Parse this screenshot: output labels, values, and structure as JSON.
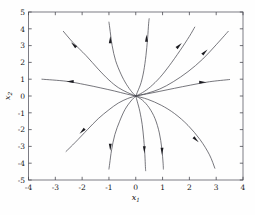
{
  "figure": {
    "background_color": "#fefefe",
    "frame_color": "#6f6f78",
    "curve_color": "#4a4a52",
    "arrow_color": "#1b1b20"
  },
  "chart_data": {
    "type": "line",
    "title": "",
    "subtitle": "",
    "xlabel": "x_1",
    "ylabel": "x_2",
    "xlim": [
      -4,
      4
    ],
    "ylim": [
      -5,
      5
    ],
    "grid": false,
    "legend": null,
    "xticks": [
      -4,
      -3,
      -2,
      -1,
      0,
      1,
      2,
      3,
      4
    ],
    "xtick_labels": [
      "-4",
      "-3",
      "-2",
      "-1",
      "0",
      "1",
      "2",
      "3",
      "4"
    ],
    "yticks": [
      -5,
      -4,
      -3,
      -2,
      -1,
      0,
      1,
      2,
      3,
      4,
      5
    ],
    "ytick_labels": [
      "-5",
      "-4",
      "-3",
      "-2",
      "-1",
      "0",
      "1",
      "2",
      "3",
      "4",
      "5"
    ],
    "equilibrium": [
      0,
      0
    ],
    "equilibrium_type": "unstable improper node",
    "flow_direction": "outward",
    "trajectories": [
      {
        "name": "upper-left-horizontal",
        "arrow_at": [
          -2.45,
          0.86
        ],
        "arrow_direction": "left",
        "points": [
          [
            0,
            0
          ],
          [
            -0.35,
            0.12
          ],
          [
            -0.8,
            0.3
          ],
          [
            -1.3,
            0.48
          ],
          [
            -1.9,
            0.68
          ],
          [
            -2.6,
            0.88
          ],
          [
            -3.5,
            1.0
          ]
        ]
      },
      {
        "name": "upper-left-diagonal",
        "arrow_at": [
          -2.32,
          3.05
        ],
        "arrow_direction": "up-left",
        "points": [
          [
            0,
            0
          ],
          [
            -0.3,
            0.2
          ],
          [
            -0.65,
            0.5
          ],
          [
            -1.0,
            0.95
          ],
          [
            -1.4,
            1.6
          ],
          [
            -1.85,
            2.4
          ],
          [
            -2.35,
            3.2
          ],
          [
            -2.7,
            3.85
          ]
        ]
      },
      {
        "name": "upper-left-steep",
        "arrow_at": [
          -0.95,
          3.35
        ],
        "arrow_direction": "up",
        "points": [
          [
            0,
            0
          ],
          [
            -0.15,
            0.25
          ],
          [
            -0.35,
            0.7
          ],
          [
            -0.55,
            1.3
          ],
          [
            -0.75,
            2.1
          ],
          [
            -0.88,
            3.0
          ],
          [
            -0.97,
            4.05
          ],
          [
            -1.0,
            4.4
          ]
        ]
      },
      {
        "name": "upper-center-steep",
        "arrow_at": [
          0.4,
          3.45
        ],
        "arrow_direction": "up",
        "points": [
          [
            0,
            0
          ],
          [
            0.08,
            0.3
          ],
          [
            0.2,
            0.8
          ],
          [
            0.3,
            1.5
          ],
          [
            0.38,
            2.4
          ],
          [
            0.44,
            3.4
          ],
          [
            0.48,
            4.3
          ],
          [
            0.5,
            4.6
          ]
        ]
      },
      {
        "name": "upper-right-mid",
        "arrow_at": [
          1.62,
          3.0
        ],
        "arrow_direction": "up-right",
        "points": [
          [
            0,
            0
          ],
          [
            0.25,
            0.2
          ],
          [
            0.55,
            0.55
          ],
          [
            0.9,
            1.1
          ],
          [
            1.25,
            1.8
          ],
          [
            1.65,
            2.7
          ],
          [
            2.0,
            3.55
          ],
          [
            2.2,
            4.1
          ]
        ]
      },
      {
        "name": "upper-right-diagonal",
        "arrow_at": [
          2.58,
          2.62
        ],
        "arrow_direction": "up-right",
        "points": [
          [
            0,
            0
          ],
          [
            0.4,
            0.15
          ],
          [
            0.9,
            0.42
          ],
          [
            1.4,
            0.85
          ],
          [
            1.95,
            1.45
          ],
          [
            2.5,
            2.2
          ],
          [
            3.0,
            3.05
          ],
          [
            3.45,
            3.85
          ]
        ]
      },
      {
        "name": "upper-right-horizontal",
        "arrow_at": [
          2.5,
          0.82
        ],
        "arrow_direction": "right",
        "points": [
          [
            0,
            0
          ],
          [
            0.4,
            0.12
          ],
          [
            0.9,
            0.28
          ],
          [
            1.45,
            0.46
          ],
          [
            2.05,
            0.65
          ],
          [
            2.75,
            0.85
          ],
          [
            3.5,
            0.98
          ]
        ]
      },
      {
        "name": "lower-left-diagonal",
        "arrow_at": [
          -2.0,
          -2.1
        ],
        "arrow_direction": "down-left",
        "points": [
          [
            0,
            0
          ],
          [
            -0.3,
            -0.15
          ],
          [
            -0.65,
            -0.42
          ],
          [
            -1.0,
            -0.82
          ],
          [
            -1.4,
            -1.35
          ],
          [
            -1.8,
            -2.0
          ],
          [
            -2.25,
            -2.75
          ],
          [
            -2.6,
            -3.3
          ]
        ]
      },
      {
        "name": "lower-left-steep",
        "arrow_at": [
          -0.95,
          -3.05
        ],
        "arrow_direction": "down",
        "points": [
          [
            0,
            0
          ],
          [
            -0.18,
            -0.3
          ],
          [
            -0.4,
            -0.8
          ],
          [
            -0.6,
            -1.5
          ],
          [
            -0.78,
            -2.3
          ],
          [
            -0.9,
            -3.2
          ],
          [
            -0.97,
            -4.0
          ],
          [
            -1.0,
            -4.35
          ]
        ]
      },
      {
        "name": "lower-center-steep",
        "arrow_at": [
          0.32,
          -3.2
        ],
        "arrow_direction": "down",
        "points": [
          [
            0,
            0
          ],
          [
            0.06,
            -0.35
          ],
          [
            0.15,
            -0.9
          ],
          [
            0.24,
            -1.7
          ],
          [
            0.3,
            -2.6
          ],
          [
            0.34,
            -3.5
          ],
          [
            0.36,
            -4.2
          ],
          [
            0.37,
            -4.45
          ]
        ]
      },
      {
        "name": "lower-right-mid",
        "arrow_at": [
          0.98,
          -3.3
        ],
        "arrow_direction": "down",
        "points": [
          [
            0,
            0
          ],
          [
            0.25,
            -0.25
          ],
          [
            0.5,
            -0.7
          ],
          [
            0.72,
            -1.35
          ],
          [
            0.88,
            -2.2
          ],
          [
            0.97,
            -3.1
          ],
          [
            1.02,
            -4.0
          ],
          [
            1.03,
            -4.35
          ]
        ]
      },
      {
        "name": "lower-right-diagonal",
        "arrow_at": [
          2.25,
          -2.6
        ],
        "arrow_direction": "down-right",
        "points": [
          [
            0,
            0
          ],
          [
            0.45,
            -0.2
          ],
          [
            0.95,
            -0.55
          ],
          [
            1.45,
            -1.05
          ],
          [
            1.95,
            -1.75
          ],
          [
            2.4,
            -2.6
          ],
          [
            2.75,
            -3.5
          ],
          [
            2.95,
            -4.3
          ]
        ]
      }
    ]
  },
  "axes": {
    "x_label_base": "x",
    "x_label_sub": "1",
    "y_label_base": "x",
    "y_label_sub": "2"
  }
}
